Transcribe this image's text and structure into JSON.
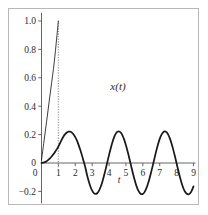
{
  "figure": {
    "background_color": "#ffffff",
    "frame_color": "#b8b8b8",
    "axis_color": "#555555",
    "curve_color": "#1a1a1a",
    "marker_color": "#9a9a9a"
  },
  "chart_data": {
    "type": "line",
    "title": "",
    "subtitle": "",
    "xlabel": "t",
    "ylabel": "",
    "curve_label": "x(t)",
    "xlim": [
      -0.35,
      9.3
    ],
    "ylim": [
      -0.27,
      1.05
    ],
    "grid": false,
    "legend": "none",
    "xticks": [
      0,
      1,
      2,
      3,
      4,
      5,
      6,
      7,
      8,
      9
    ],
    "xticklabels": [
      "0",
      "1",
      "2",
      "3",
      "4",
      "5",
      "6",
      "7",
      "8",
      "9"
    ],
    "yticks": [
      -0.2,
      0,
      0.2,
      0.4,
      0.6,
      0.8,
      1.0
    ],
    "yticklabels": [
      "-0.2",
      "0",
      "0.2",
      "0.4",
      "0.6",
      "0.8",
      "1.0"
    ],
    "annotations": [
      {
        "name": "vertical-dotted-marker",
        "style": "dotted",
        "color": "#9a9a9a",
        "x": 1.0,
        "y_from": -0.03,
        "y_to": 1.0
      }
    ],
    "series": [
      {
        "name": "ramp-segment",
        "style": "thin-solid",
        "description": "steep near-linear rise reaching 1.0 at t=1",
        "x": [
          0.0,
          0.15,
          0.3,
          0.45,
          0.6,
          0.75,
          0.9,
          1.0
        ],
        "y": [
          0.02,
          0.155,
          0.29,
          0.43,
          0.565,
          0.705,
          0.88,
          1.0
        ]
      },
      {
        "name": "oscillation",
        "style": "thick-solid",
        "description": "sustained oscillation, amplitude about 0.22, period about 3.1",
        "x": [
          0.0,
          0.1,
          0.2,
          0.3,
          0.4,
          0.5,
          0.6,
          0.7,
          0.8,
          0.9,
          1.0,
          1.1,
          1.2,
          1.3,
          1.4,
          1.5,
          1.6,
          1.7,
          1.8,
          1.9,
          2.0,
          2.1,
          2.2,
          2.3,
          2.4,
          2.5,
          2.6,
          2.7,
          2.8,
          2.9,
          3.0,
          3.1,
          3.2,
          3.3,
          3.4,
          3.5,
          3.6,
          3.7,
          3.8,
          3.9,
          4.0,
          4.1,
          4.2,
          4.3,
          4.4,
          4.5,
          4.6,
          4.7,
          4.8,
          4.9,
          5.0,
          5.1,
          5.2,
          5.3,
          5.4,
          5.5,
          5.6,
          5.7,
          5.8,
          5.9,
          6.0,
          6.1,
          6.2,
          6.3,
          6.4,
          6.5,
          6.6,
          6.7,
          6.8,
          6.9,
          7.0,
          7.1,
          7.2,
          7.3,
          7.4,
          7.5,
          7.6,
          7.7,
          7.8,
          7.9,
          8.0,
          8.1,
          8.2,
          8.3,
          8.4,
          8.5,
          8.6,
          8.7,
          8.8,
          8.9,
          9.0
        ],
        "y": [
          0.0,
          0.002,
          0.006,
          0.013,
          0.022,
          0.033,
          0.046,
          0.061,
          0.078,
          0.096,
          0.115,
          0.14,
          0.165,
          0.186,
          0.203,
          0.215,
          0.221,
          0.221,
          0.214,
          0.201,
          0.182,
          0.157,
          0.126,
          0.091,
          0.052,
          0.01,
          -0.033,
          -0.086,
          -0.13,
          -0.167,
          -0.195,
          -0.212,
          -0.218,
          -0.213,
          -0.196,
          -0.169,
          -0.133,
          -0.09,
          -0.043,
          0.007,
          0.057,
          0.104,
          0.146,
          0.182,
          0.207,
          0.22,
          0.222,
          0.213,
          0.193,
          0.163,
          0.125,
          0.081,
          0.033,
          -0.017,
          -0.067,
          -0.113,
          -0.154,
          -0.186,
          -0.208,
          -0.219,
          -0.218,
          -0.205,
          -0.181,
          -0.148,
          -0.107,
          -0.061,
          -0.012,
          0.038,
          0.087,
          0.132,
          0.17,
          0.198,
          0.216,
          0.222,
          0.217,
          0.2,
          0.173,
          0.137,
          0.094,
          0.047,
          -0.003,
          -0.053,
          -0.101,
          -0.143,
          -0.178,
          -0.203,
          -0.217,
          -0.221,
          -0.213,
          -0.194,
          -0.165
        ]
      }
    ]
  }
}
